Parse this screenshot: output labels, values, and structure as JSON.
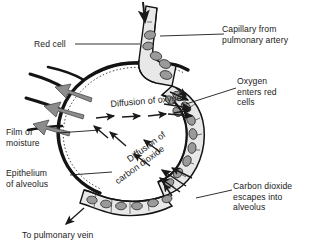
{
  "figure": {
    "background": "#ffffff",
    "ink": "#1a1a1a",
    "cell_fill": "#9a9a9a",
    "wall_fill": "#e2e2e2",
    "arrow_gray": "#8c8c8c"
  },
  "labels": {
    "capillary_artery": "Capillary from\npulmonary artery",
    "red_cell": "Red cell",
    "oxygen_enters": "Oxygen\nenters red\ncells",
    "film_of_moisture": "Film of\nmoisture",
    "epithelium": "Epithelium\nof alveolus",
    "carbon_dioxide_escapes": "Carbon dioxide\nescapes into\nalveolus",
    "to_pulmonary_vein": "To pulmonary vein"
  },
  "inline_labels": {
    "diffusion_oxygen": "Diffusion of oxygen",
    "diffusion_co2_line1": "Diffusion of",
    "diffusion_co2_line2": "carbon dioxide"
  }
}
